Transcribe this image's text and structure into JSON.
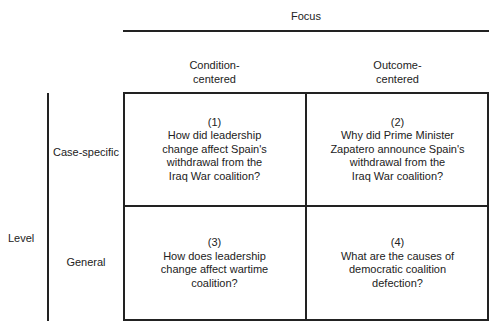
{
  "focus": {
    "title": "Focus",
    "columns": [
      {
        "line1": "Condition-",
        "line2": "centered"
      },
      {
        "line1": "Outcome-",
        "line2": "centered"
      }
    ]
  },
  "level": {
    "title": "Level",
    "rows": [
      "Case-specific",
      "General"
    ]
  },
  "cells": [
    {
      "num": "(1)",
      "lines": [
        "How did leadership",
        "change affect Spain's",
        "withdrawal from the",
        "Iraq War coalition?"
      ]
    },
    {
      "num": "(2)",
      "lines": [
        "Why did Prime Minister",
        "Zapatero announce Spain's",
        "withdrawal from the",
        "Iraq War coalition?"
      ]
    },
    {
      "num": "(3)",
      "lines": [
        "How does leadership",
        "change affect wartime",
        "coalition?"
      ]
    },
    {
      "num": "(4)",
      "lines": [
        "What are the causes of",
        "democratic coalition",
        "defection?"
      ]
    }
  ]
}
